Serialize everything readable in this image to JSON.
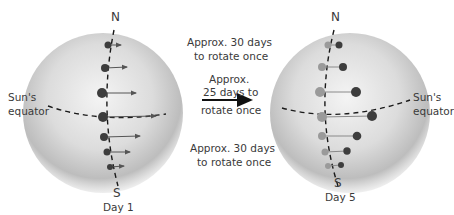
{
  "left_panel": {
    "caption": "Day 1",
    "north_label": "N",
    "south_label": "S",
    "equator_label_line1": "Sun's",
    "equator_label_line2": "equator"
  },
  "right_panel": {
    "caption": "Day 5",
    "north_label": "N",
    "south_label": "S",
    "equator_label_line1": "Sun's",
    "equator_label_line2": "equator"
  },
  "middle_labels": {
    "top_line1": "Approx. 30 days",
    "top_line2": "to rotate once",
    "equator_line1": "Approx.",
    "equator_line2": "25 days to",
    "equator_line3": "rotate once",
    "bottom_line1": "Approx. 30 days",
    "bottom_line2": "to rotate once"
  },
  "colors": {
    "sphere_light": "#f2f2f2",
    "sphere_dark": "#a9a9a9",
    "dot_dark": "#3d3d3d",
    "dot_grey": "#9a9a9a",
    "line": "#1a1a1a",
    "arrow": "#555555"
  }
}
